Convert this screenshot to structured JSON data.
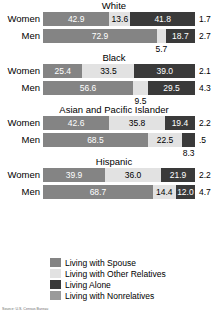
{
  "chart_data": {
    "type": "bar",
    "subtype": "stacked-horizontal-100pct",
    "title": "",
    "xlabel": "",
    "ylabel": "",
    "xlim": [
      0,
      100
    ],
    "grid": false,
    "legend_position": "bottom",
    "series": [
      {
        "name": "Living with Spouse",
        "color": "#848484"
      },
      {
        "name": "Living with Other Relatives",
        "color": "#e2e2e2"
      },
      {
        "name": "Living Alone",
        "color": "#3a3a3a"
      },
      {
        "name": "Living with Nonrelatives",
        "color": "#9a9a9a"
      }
    ],
    "groups": [
      {
        "name": "White",
        "rows": [
          {
            "label": "Women",
            "values": [
              42.9,
              13.6,
              41.8,
              1.7
            ],
            "labels": [
              "42.9",
              "13.6",
              "41.8",
              "1.7"
            ]
          },
          {
            "label": "Men",
            "values": [
              72.9,
              5.7,
              18.7,
              2.7
            ],
            "labels": [
              "72.9",
              "5.7",
              "18.7",
              "2.7"
            ]
          }
        ]
      },
      {
        "name": "Black",
        "rows": [
          {
            "label": "Women",
            "values": [
              25.4,
              33.5,
              39.0,
              2.1
            ],
            "labels": [
              "25.4",
              "33.5",
              "39.0",
              "2.1"
            ]
          },
          {
            "label": "Men",
            "values": [
              56.6,
              9.5,
              29.5,
              4.3
            ],
            "labels": [
              "56.6",
              "9.5",
              "29.5",
              "4.3"
            ]
          }
        ]
      },
      {
        "name": "Asian and Pacific Islander",
        "rows": [
          {
            "label": "Women",
            "values": [
              42.6,
              35.8,
              19.4,
              2.2
            ],
            "labels": [
              "42.6",
              "35.8",
              "19.4",
              "2.2"
            ]
          },
          {
            "label": "Men",
            "values": [
              68.5,
              22.5,
              8.3,
              0.5
            ],
            "labels": [
              "68.5",
              "22.5",
              "8.3",
              ".5"
            ]
          }
        ]
      },
      {
        "name": "Hispanic",
        "rows": [
          {
            "label": "Women",
            "values": [
              39.9,
              36.0,
              21.9,
              2.2
            ],
            "labels": [
              "39.9",
              "36.0",
              "21.9",
              "2.2"
            ]
          },
          {
            "label": "Men",
            "values": [
              68.7,
              14.4,
              12.0,
              4.7
            ],
            "labels": [
              "68.7",
              "14.4",
              "12.0",
              "4.7"
            ]
          }
        ]
      }
    ],
    "legend": [
      "Living with Spouse",
      "Living with Other Relatives",
      "Living Alone",
      "Living with Nonrelatives"
    ]
  },
  "source": {
    "text": "Source: U.S. Census Bureau"
  }
}
